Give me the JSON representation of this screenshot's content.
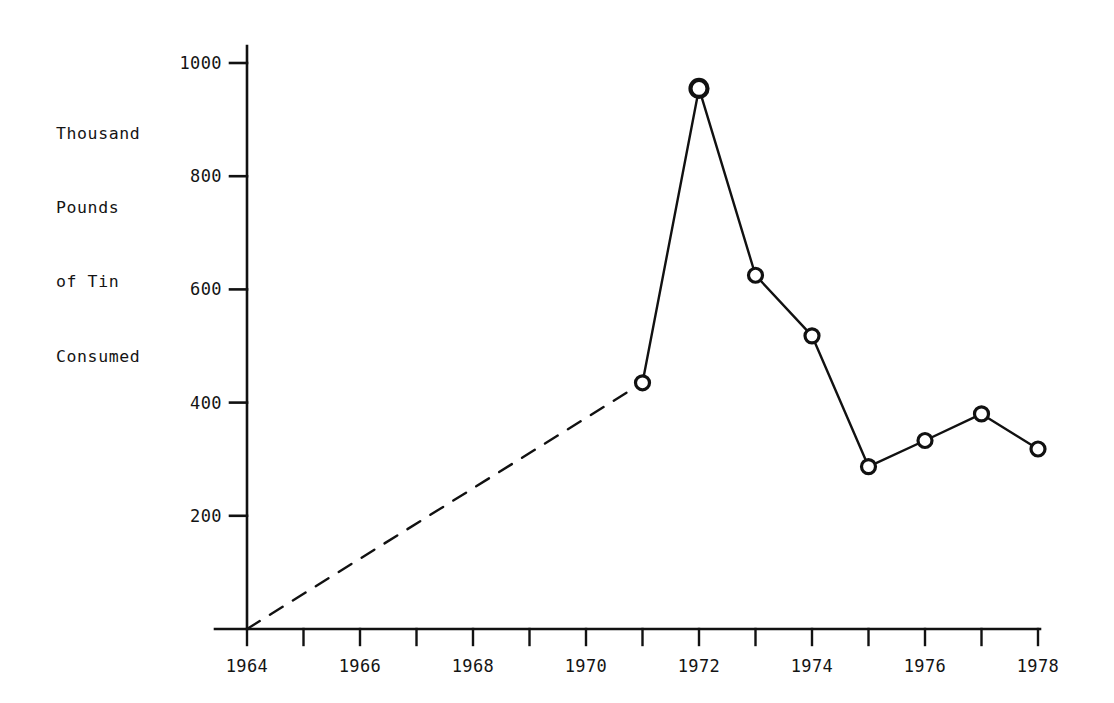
{
  "chart_data": {
    "type": "line",
    "title": "",
    "subtitle": "",
    "xlabel": "",
    "ylabel": "Thousand Pounds of Tin Consumed",
    "ylabel_lines": [
      "Thousand",
      "Pounds",
      "of Tin",
      "Consumed"
    ],
    "x": [
      1964,
      1971,
      1972,
      1973,
      1974,
      1975,
      1976,
      1977,
      1978
    ],
    "values": [
      0,
      435,
      955,
      625,
      518,
      287,
      333,
      380,
      318
    ],
    "series": [
      {
        "name": "Tin consumed",
        "x": [
          1964,
          1971,
          1972,
          1973,
          1974,
          1975,
          1976,
          1977,
          1978
        ],
        "values": [
          0,
          435,
          955,
          625,
          518,
          287,
          333,
          380,
          318
        ]
      }
    ],
    "segments": [
      {
        "style": "dashed",
        "from_x": 1964,
        "from_y": 0,
        "to_x": 1971,
        "to_y": 435,
        "marker_at_start": false,
        "marker_at_end": true
      },
      {
        "style": "solid",
        "from_x": 1971,
        "from_y": 435,
        "to_x": 1972,
        "to_y": 955,
        "marker_at_start": true,
        "marker_at_end": true
      },
      {
        "style": "solid",
        "from_x": 1972,
        "from_y": 955,
        "to_x": 1973,
        "to_y": 625,
        "marker_at_start": true,
        "marker_at_end": true
      },
      {
        "style": "solid",
        "from_x": 1973,
        "from_y": 625,
        "to_x": 1974,
        "to_y": 518,
        "marker_at_start": true,
        "marker_at_end": true
      },
      {
        "style": "solid",
        "from_x": 1974,
        "from_y": 518,
        "to_x": 1975,
        "to_y": 287,
        "marker_at_start": true,
        "marker_at_end": true
      },
      {
        "style": "solid",
        "from_x": 1975,
        "from_y": 287,
        "to_x": 1976,
        "to_y": 333,
        "marker_at_start": true,
        "marker_at_end": true
      },
      {
        "style": "solid",
        "from_x": 1976,
        "from_y": 333,
        "to_x": 1977,
        "to_y": 380,
        "marker_at_start": true,
        "marker_at_end": true
      },
      {
        "style": "solid",
        "from_x": 1977,
        "from_y": 380,
        "to_x": 1978,
        "to_y": 318,
        "marker_at_start": true,
        "marker_at_end": true
      }
    ],
    "marker": "open-circle",
    "xlim": [
      1964,
      1978
    ],
    "ylim": [
      0,
      1000
    ],
    "x_ticks": [
      1964,
      1965,
      1966,
      1967,
      1968,
      1969,
      1970,
      1971,
      1972,
      1973,
      1974,
      1975,
      1976,
      1977,
      1978
    ],
    "x_tick_labels": [
      "1964",
      "",
      "1966",
      "",
      "1968",
      "",
      "1970",
      "",
      "1972",
      "",
      "1974",
      "",
      "1976",
      "",
      "1978"
    ],
    "y_ticks": [
      200,
      400,
      600,
      800,
      1000
    ],
    "y_tick_labels": [
      "200",
      "400",
      "600",
      "800",
      "1000"
    ],
    "grid": false,
    "legend": "none",
    "line_color": "#111111",
    "axis_color": "#111111",
    "background_color": "#ffffff"
  }
}
